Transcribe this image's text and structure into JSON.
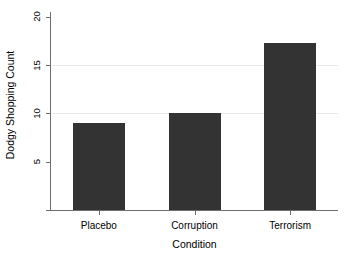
{
  "chart_data": {
    "type": "bar",
    "title": "",
    "subtitle": "",
    "xlabel": "Condition",
    "ylabel": "Dodgy Shopping Count",
    "categories": [
      "Placebo",
      "Corruption",
      "Terrorism"
    ],
    "values": [
      9.0,
      10.0,
      17.3
    ],
    "series": [
      {
        "name": "Dodgy Shopping Count",
        "values": [
          9.0,
          10.0,
          17.3
        ]
      }
    ],
    "ylim": [
      0,
      20.5
    ],
    "yticks": [
      5,
      10,
      15,
      20
    ],
    "ytick_labels": [
      "5",
      "10",
      "15",
      "20"
    ],
    "xtick_labels": [
      "Placebo",
      "Corruption",
      "Terrorism"
    ],
    "grid": "horizontal",
    "legend": "none",
    "legend_position": "none",
    "bar_color": "#333333",
    "grid_color": "#eaeaea",
    "axis_color": "#6e6e6e",
    "background_color": "#ffffff",
    "annotations": []
  },
  "axes": {
    "y_title": "Dodgy Shopping Count",
    "x_title": "Condition",
    "y_ticks": [
      {
        "label": "20",
        "value": 20
      },
      {
        "label": "15",
        "value": 15
      },
      {
        "label": "10",
        "value": 10
      },
      {
        "label": "5",
        "value": 5
      }
    ],
    "x_ticks": [
      {
        "label": "Placebo",
        "value": 9.0
      },
      {
        "label": "Corruption",
        "value": 10.0
      },
      {
        "label": "Terrorism",
        "value": 17.3
      }
    ]
  }
}
